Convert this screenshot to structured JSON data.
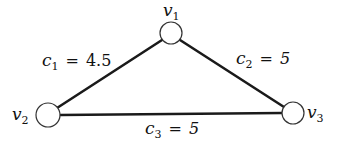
{
  "diagram": {
    "type": "weighted-triangle-graph",
    "nodes": [
      {
        "id": "v1",
        "label": "v",
        "sub": "1"
      },
      {
        "id": "v2",
        "label": "v",
        "sub": "2"
      },
      {
        "id": "v3",
        "label": "v",
        "sub": "3"
      }
    ],
    "edges": [
      {
        "from": "v1",
        "to": "v2",
        "var": "c",
        "sub": "1",
        "eq": "=",
        "value": "4.5"
      },
      {
        "from": "v1",
        "to": "v3",
        "var": "c",
        "sub": "2",
        "eq": "=",
        "value": "5"
      },
      {
        "from": "v2",
        "to": "v3",
        "var": "c",
        "sub": "3",
        "eq": "=",
        "value": "5"
      }
    ],
    "colors": {
      "edge": "#1a1a1a",
      "node_fill": "#ffffff",
      "node_stroke": "#333333",
      "text": "#111111",
      "background": "#ffffff"
    }
  }
}
